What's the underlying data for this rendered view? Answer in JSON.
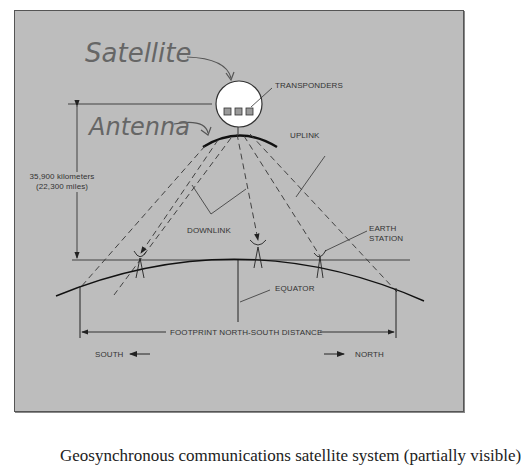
{
  "figure": {
    "title_labels": {
      "satellite": "Satellite",
      "antenna": "Antenna"
    },
    "labels": {
      "transponders": "TRANSPONDERS",
      "uplink": "UPLINK",
      "downlink": "DOWNLINK",
      "earth_station_line1": "EARTH",
      "earth_station_line2": "STATION",
      "equator": "EQUATOR",
      "footprint": "FOOTPRINT NORTH-SOUTH DISTANCE",
      "south": "SOUTH",
      "north": "NORTH",
      "altitude_km": "35,900 kilometers",
      "altitude_mi": "(22,300 miles)"
    },
    "colors": {
      "panel_bg": "#bdbdbd",
      "line": "#222222",
      "satellite_fill": "#ffffff",
      "transponder_fill": "#9a9a9a",
      "handwriting": "#666666"
    },
    "transponder_count": 3,
    "earth_station_count": 3
  },
  "caption": {
    "text": "Geosynchronous communications satellite system (partially visible)"
  }
}
